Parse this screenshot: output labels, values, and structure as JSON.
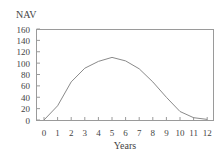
{
  "chart_data": {
    "type": "line",
    "title": "",
    "ylabel": "NAV",
    "xlabel": "Years",
    "x": [
      0,
      1,
      2,
      3,
      4,
      5,
      6,
      7,
      8,
      9,
      10,
      11,
      12
    ],
    "series": [
      {
        "name": "NAV",
        "values": [
          0,
          25,
          67,
          91,
          103,
          110,
          104,
          90,
          67,
          40,
          15,
          4,
          1
        ]
      }
    ],
    "xticks": [
      "0",
      "1",
      "2",
      "3",
      "4",
      "5",
      "6",
      "7",
      "8",
      "9",
      "10",
      "11",
      "12"
    ],
    "yticks": [
      "0",
      "20",
      "40",
      "60",
      "80",
      "100",
      "120",
      "140",
      "160"
    ],
    "ylim": [
      0,
      160
    ],
    "xlim": [
      -0.6,
      12.5
    ],
    "grid": false,
    "legend": "none",
    "colors": {
      "line": "#8a8a8a",
      "axis": "#9a9a9a",
      "text": "#444444"
    }
  }
}
